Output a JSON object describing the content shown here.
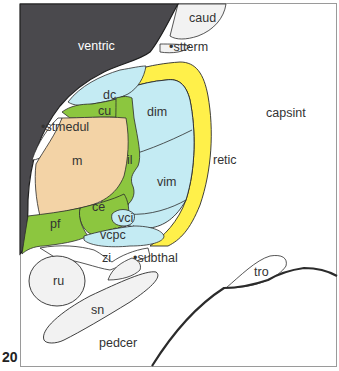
{
  "plate_number": "20",
  "colors": {
    "ventricle": "#4a494d",
    "medial_nucleus": "#f3d3a6",
    "intralaminar_green": "#8cc63f",
    "ventral_blue": "#c4ebf3",
    "reticular_yellow": "#fff04a",
    "neutral_region": "#f2f2f2",
    "outline": "#2b2b2b",
    "frame": "#9a9a9a"
  },
  "regions": {
    "ventric": "ventric",
    "caud": "caud",
    "stterm": "•stterm",
    "dc": "dc",
    "cu": "cu",
    "dim": "dim",
    "capsint": "capsint",
    "stmedul": "•stmedul",
    "m": "m",
    "il": "il",
    "retic": "retic",
    "vim": "vim",
    "ce": "ce",
    "pf": "pf",
    "vci": "vci",
    "vcpc": "vcpc",
    "zi": "zi",
    "subthal": "•subthal",
    "ru": "ru",
    "tro": "tro",
    "sn": "sn",
    "pedcer": "pedcer"
  }
}
